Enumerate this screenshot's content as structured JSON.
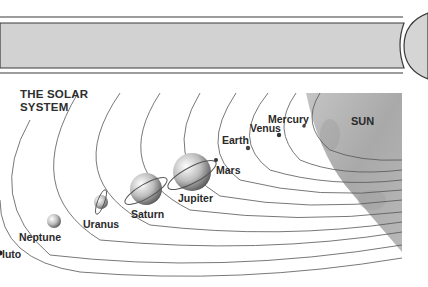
{
  "title": {
    "line1": "THE SOLAR",
    "line2": "SYSTEM"
  },
  "sun": {
    "label": "SUN",
    "color": "#b3b3b3"
  },
  "header_bar": {
    "fill": "#d2d2d2",
    "stroke": "#3a3a3a"
  },
  "planets": [
    {
      "name": "Mercury",
      "label": "Mercury"
    },
    {
      "name": "Venus",
      "label": "Venus"
    },
    {
      "name": "Earth",
      "label": "Earth"
    },
    {
      "name": "Mars",
      "label": "Mars"
    },
    {
      "name": "Jupiter",
      "label": "Jupiter"
    },
    {
      "name": "Saturn",
      "label": "Saturn"
    },
    {
      "name": "Uranus",
      "label": "Uranus"
    },
    {
      "name": "Neptune",
      "label": "Neptune"
    },
    {
      "name": "Pluto",
      "label": "luto"
    }
  ]
}
